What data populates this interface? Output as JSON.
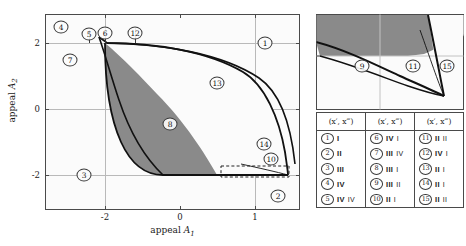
{
  "figure": {
    "type": "phase-diagram",
    "axes": {
      "xlabel": "appeal A1",
      "ylabel": "appeal A2",
      "xticks": [
        "-2",
        "0",
        "1"
      ],
      "xtick_values": [
        -2,
        0,
        1
      ],
      "yticks": [
        "2",
        "0",
        "-2"
      ],
      "ytick_values": [
        2,
        0,
        -2
      ],
      "xlim": [
        -3.2,
        1.9
      ],
      "ylim": [
        -3.0,
        2.9
      ],
      "gridlines_x": [
        -2,
        1
      ],
      "gridlines_y": [
        2,
        0,
        -2
      ]
    },
    "region_labels": [
      {
        "id": "1",
        "text": "1",
        "x": 1.18,
        "y": 2.08
      },
      {
        "id": "2",
        "text": "2",
        "x": 1.45,
        "y": -2.62
      },
      {
        "id": "3",
        "text": "3",
        "x": -2.34,
        "y": -2.02
      },
      {
        "id": "4",
        "text": "4",
        "x": -2.9,
        "y": 2.55
      },
      {
        "id": "5",
        "text": "5",
        "x": -2.46,
        "y": 2.37
      },
      {
        "id": "6",
        "text": "6",
        "x": -2.04,
        "y": 2.38
      },
      {
        "id": "7",
        "text": "7",
        "x": -2.72,
        "y": 1.5
      },
      {
        "id": "8",
        "text": "8",
        "x": -0.52,
        "y": -0.34
      },
      {
        "id": "9",
        "text": "9",
        "x": -1.72,
        "y": -0.3
      },
      {
        "id": "10",
        "text": "10",
        "x": 1.02,
        "y": -1.52
      },
      {
        "id": "11",
        "text": "11",
        "x": 0.92,
        "y": 2.0
      },
      {
        "id": "12",
        "text": "12",
        "x": -1.65,
        "y": 2.38
      },
      {
        "id": "13",
        "text": "13",
        "x": 0.52,
        "y": 0.78
      },
      {
        "id": "14",
        "text": "14",
        "x": 0.96,
        "y": -1.18
      },
      {
        "id": "15",
        "text": "15",
        "x": 1.44,
        "y": 2.0
      }
    ],
    "inset": {
      "labels": [
        {
          "id": "9",
          "text": "9"
        },
        {
          "id": "11",
          "text": "11"
        },
        {
          "id": "15",
          "text": "15"
        }
      ]
    },
    "legend": {
      "columns": [
        {
          "header": "(x′, x‴)",
          "rows": [
            {
              "num": "1",
              "v1": "I",
              "v2": ""
            },
            {
              "num": "2",
              "v1": "II",
              "v2": ""
            },
            {
              "num": "3",
              "v1": "III",
              "v2": ""
            },
            {
              "num": "4",
              "v1": "IV",
              "v2": ""
            },
            {
              "num": "5",
              "v1": "IV",
              "v2": "IV"
            }
          ]
        },
        {
          "header": "(x′, x‴)",
          "rows": [
            {
              "num": "6",
              "v1": "IV",
              "v2": "I"
            },
            {
              "num": "7",
              "v1": "III",
              "v2": "IV"
            },
            {
              "num": "8",
              "v1": "III",
              "v2": "I"
            },
            {
              "num": "9",
              "v1": "III",
              "v2": "II"
            },
            {
              "num": "10",
              "v1": "II",
              "v2": "I"
            }
          ]
        },
        {
          "header": "(x′, x‴)",
          "rows": [
            {
              "num": "11",
              "v1": "II",
              "v2": "II"
            },
            {
              "num": "12",
              "v1": "IV",
              "v2": "I"
            },
            {
              "num": "13",
              "v1": "II",
              "v2": "I"
            },
            {
              "num": "14",
              "v1": "II",
              "v2": "I"
            },
            {
              "num": "15",
              "v1": "II",
              "v2": "II"
            }
          ]
        }
      ]
    },
    "colors": {
      "shaded_region": "#8a8a8a",
      "curve": "#111111",
      "frame": "#4a4a4a",
      "grid": "#b9b9b9",
      "background": "#fbfbfb"
    }
  }
}
